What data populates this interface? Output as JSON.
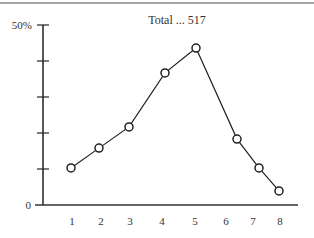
{
  "chart_data": {
    "type": "line",
    "title": "Total ... 517",
    "xlabel": "",
    "ylabel": "",
    "x": [
      1,
      2,
      3,
      4,
      5,
      6,
      7,
      8
    ],
    "categories": [
      "1",
      "2",
      "3",
      "4",
      "5",
      "6",
      "7",
      "8"
    ],
    "values": [
      10.3,
      15.8,
      21.7,
      36.7,
      43.6,
      18.3,
      10.3,
      3.9
    ],
    "unit": "%",
    "ylim": [
      0,
      50
    ],
    "yticks": [
      0,
      10,
      20,
      30,
      40,
      50
    ],
    "ytick_labels": [
      "0",
      "",
      "",
      "",
      "",
      "50%"
    ],
    "grid": false,
    "legend": null,
    "marker": "open-circle",
    "line_color": "#222222"
  },
  "layout": {
    "y_zero_px": 205,
    "y_top_px": 25,
    "x_label_px": [
      72,
      101,
      130,
      162,
      195,
      226,
      253,
      280
    ],
    "point_x_px": [
      71,
      99,
      129,
      165,
      196,
      237,
      259,
      279
    ]
  }
}
